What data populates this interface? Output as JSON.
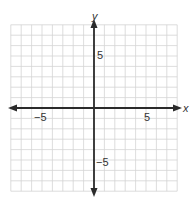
{
  "chart_data": {
    "type": "scatter",
    "title": "",
    "xlabel": "x",
    "ylabel": "y",
    "xlim": [
      -8,
      8
    ],
    "ylim": [
      -8,
      8
    ],
    "grid": true,
    "grid_step": 1,
    "x_tick_labels": [
      {
        "value": -5,
        "label": "−5"
      },
      {
        "value": 5,
        "label": "5"
      }
    ],
    "y_tick_labels": [
      {
        "value": 5,
        "label": "5"
      },
      {
        "value": -5,
        "label": "−5"
      }
    ],
    "series": [],
    "arrows_on_axes": true
  },
  "labels": {
    "x_axis": "x",
    "y_axis": "y",
    "x_neg5": "−5",
    "x_pos5": "5",
    "y_pos5": "5",
    "y_neg5": "−5"
  },
  "colors": {
    "grid": "#d4d4d4",
    "axis": "#2b2b2b",
    "text": "#333333"
  }
}
